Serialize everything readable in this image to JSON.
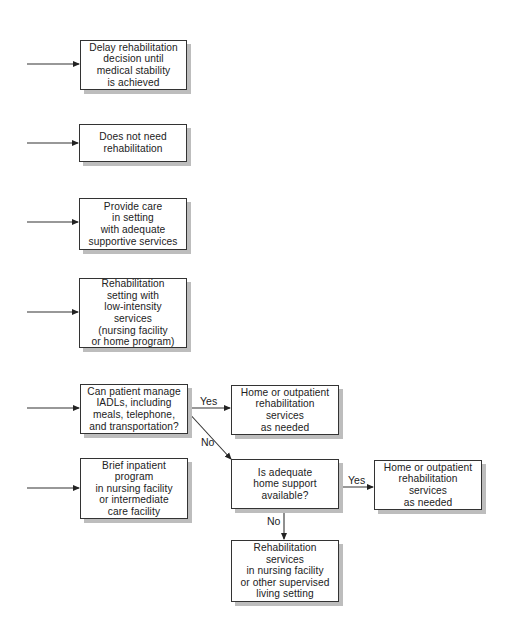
{
  "diagram": {
    "type": "flowchart",
    "nodes": [
      {
        "id": "delay",
        "lines": [
          "Delay rehabilitation",
          "decision until",
          "medical stability",
          "is achieved"
        ]
      },
      {
        "id": "no_need",
        "lines": [
          "Does not need",
          "rehabilitation"
        ]
      },
      {
        "id": "provide_care",
        "lines": [
          "Provide care",
          "in setting",
          "with adequate",
          "supportive services"
        ]
      },
      {
        "id": "low_intensity",
        "lines": [
          "Rehabilitation",
          "setting with",
          "low-intensity",
          "services",
          "(nursing facility",
          "or home program)"
        ]
      },
      {
        "id": "iadl_question",
        "lines": [
          "Can patient manage",
          "IADLs, including",
          "meals, telephone,",
          "and transportation?"
        ]
      },
      {
        "id": "home_outpatient_1",
        "lines": [
          "Home or outpatient",
          "rehabilitation",
          "services",
          "as needed"
        ]
      },
      {
        "id": "home_support_question",
        "lines": [
          "Is adequate",
          "home support",
          "available?"
        ]
      },
      {
        "id": "home_outpatient_2",
        "lines": [
          "Home or outpatient",
          "rehabilitation",
          "services",
          "as needed"
        ]
      },
      {
        "id": "supervised_setting",
        "lines": [
          "Rehabilitation",
          "services",
          "in nursing facility",
          "or other supervised",
          "living setting"
        ]
      },
      {
        "id": "brief_inpatient",
        "lines": [
          "Brief inpatient",
          "program",
          "in nursing facility",
          "or intermediate",
          "care facility"
        ]
      }
    ],
    "edges": [
      {
        "from": "iadl_question",
        "to": "home_outpatient_1",
        "label": "Yes"
      },
      {
        "from": "iadl_question",
        "to": "home_support_question",
        "label": "No"
      },
      {
        "from": "home_support_question",
        "to": "home_outpatient_2",
        "label": "Yes"
      },
      {
        "from": "home_support_question",
        "to": "supervised_setting",
        "label": "No"
      }
    ],
    "labels": {
      "yes1": "Yes",
      "no1": "No",
      "yes2": "Yes",
      "no2": "No"
    }
  }
}
